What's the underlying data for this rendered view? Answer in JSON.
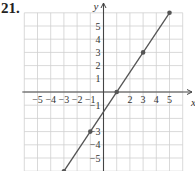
{
  "problem": {
    "number": "21."
  },
  "chart_data": {
    "type": "line",
    "title": "",
    "xlabel": "x",
    "ylabel": "y",
    "xlim": [
      -6,
      6
    ],
    "ylim": [
      -6,
      6
    ],
    "grid": true,
    "x_ticks": [
      -5,
      -4,
      -3,
      -2,
      -1,
      2,
      3,
      4,
      5
    ],
    "y_ticks": [
      5,
      4,
      3,
      2,
      1,
      -1,
      -3,
      -4,
      -5
    ],
    "x_tick_labels": [
      "−5",
      "−4",
      "−3",
      "−2",
      "−1",
      "2",
      "3",
      "4",
      "5"
    ],
    "y_tick_labels": [
      "5",
      "4",
      "3",
      "2",
      "1",
      "−1",
      "−3",
      "−4",
      "−5"
    ],
    "series": [
      {
        "name": "line",
        "equation": "y = 1.5x − 1.5",
        "color": "#555555",
        "points": [
          {
            "x": -3,
            "y": -6
          },
          {
            "x": -1,
            "y": -3
          },
          {
            "x": 1,
            "y": 0
          },
          {
            "x": 3,
            "y": 3
          },
          {
            "x": 5,
            "y": 6
          }
        ]
      }
    ]
  },
  "colors": {
    "grid": "#cfcfcf",
    "axis": "#444444",
    "line": "#555555",
    "point": "#555555"
  }
}
